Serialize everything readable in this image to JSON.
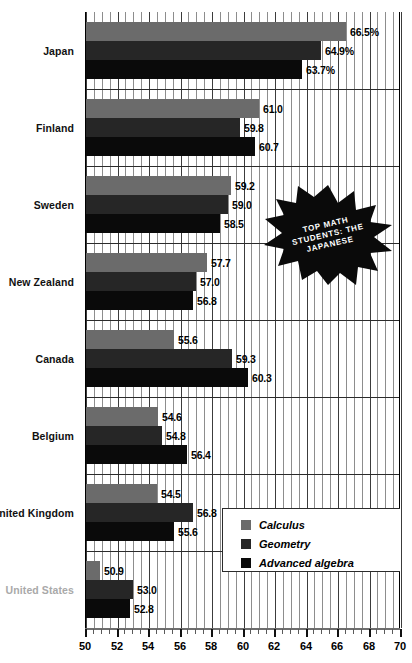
{
  "chart_data": {
    "type": "bar",
    "title": "Top math students: the Japanese",
    "orientation": "horizontal",
    "xlabel": "",
    "ylabel": "",
    "xlim": [
      50,
      70
    ],
    "xticks": [
      50,
      52,
      54,
      56,
      58,
      60,
      62,
      64,
      66,
      68,
      70
    ],
    "tick_labels": [
      "50",
      "52",
      "54",
      "56",
      "58",
      "60",
      "62",
      "64",
      "66",
      "68",
      "70"
    ],
    "grid": true,
    "grid_step": 0.5,
    "legend_position": "bottom-right",
    "categories": [
      "Japan",
      "Finland",
      "Sweden",
      "New Zealand",
      "Canada",
      "Belgium",
      "United Kingdom",
      "United States"
    ],
    "series": [
      {
        "name": "Calculus",
        "color": "#6b6b6b",
        "values": [
          66.5,
          61.0,
          59.2,
          57.7,
          55.6,
          54.6,
          54.5,
          50.9
        ],
        "labels": [
          "66.5%",
          "61.0",
          "59.2",
          "57.7",
          "55.6",
          "54.6",
          "54.5",
          "50.9"
        ]
      },
      {
        "name": "Geometry",
        "color": "#262626",
        "values": [
          64.9,
          59.8,
          59.0,
          57.0,
          59.3,
          54.8,
          56.8,
          53.0
        ],
        "labels": [
          "64.9%",
          "59.8",
          "59.0",
          "57.0",
          "59.3",
          "54.8",
          "56.8",
          "53.0"
        ]
      },
      {
        "name": "Advanced algebra",
        "color": "#0a0a0a",
        "values": [
          63.7,
          60.7,
          58.5,
          56.8,
          60.3,
          56.4,
          55.6,
          52.8
        ],
        "labels": [
          "63.7%",
          "60.7",
          "58.5",
          "56.8",
          "60.3",
          "56.4",
          "55.6",
          "52.8"
        ]
      }
    ],
    "annotation": {
      "shape": "starburst",
      "lines": [
        "TOP MATH",
        "STUDENTS: THE",
        "JAPANESE"
      ],
      "text_color": "#ffffff",
      "fill_color": "#0a0a0a"
    },
    "muted_category": "United States",
    "muted_color": "#a9a9a9"
  },
  "legend": {
    "items": [
      {
        "label": "Calculus",
        "swatch": "legend-swatch-calculus"
      },
      {
        "label": "Geometry",
        "swatch": "legend-swatch-geometry"
      },
      {
        "label": "Advanced algebra",
        "swatch": "legend-swatch-advanced-algebra"
      }
    ]
  }
}
